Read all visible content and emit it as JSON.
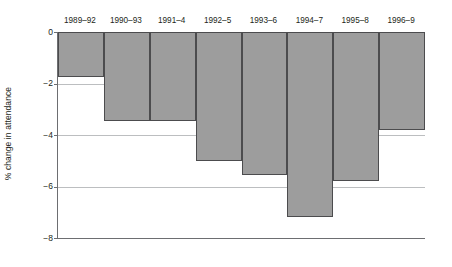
{
  "chart_data": {
    "type": "bar",
    "title": "",
    "subtitle": "",
    "xlabel": "",
    "ylabel": "% change in attendance",
    "categories": [
      "1989–92",
      "1990–93",
      "1991–4",
      "1992–5",
      "1993–6",
      "1994–7",
      "1995–8",
      "1996–9"
    ],
    "values": [
      -1.75,
      -3.45,
      -3.45,
      -5.0,
      -5.55,
      -7.2,
      -5.8,
      -3.8
    ],
    "series": [
      {
        "name": "% change in attendance",
        "values": [
          -1.75,
          -3.45,
          -3.45,
          -5.0,
          -5.55,
          -7.2,
          -5.8,
          -3.8
        ]
      }
    ],
    "ylim": [
      -8,
      0
    ],
    "xlim_note": "categorical",
    "yticks": [
      0,
      -2,
      -4,
      -6,
      -8
    ],
    "ytick_labels": [
      "0",
      "−2",
      "−4",
      "−6",
      "−8"
    ],
    "grid": "horizontal",
    "legend": "none",
    "bar_fill_color": "#9d9d9d",
    "bar_edge_color": "#4c4c4e",
    "gridline_color": "#bcbec0",
    "axis_color": "#6d6e71",
    "text_color": "#231f20",
    "background_color": "#ffffff",
    "category_label_position": "top"
  }
}
